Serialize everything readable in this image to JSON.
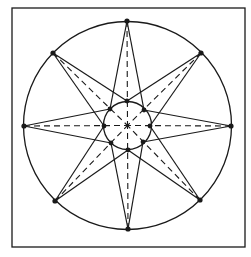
{
  "diagram": {
    "title": "",
    "type": "eight-pointed star construction",
    "colors": {
      "stroke": "#1a1a1a",
      "background": "#ffffff"
    },
    "frame": {
      "x": 12,
      "y": 8,
      "width": 233,
      "height": 239
    },
    "outer_circle": {
      "cx": 127.5,
      "cy": 125.5,
      "r": 104
    },
    "inner_circle": {
      "cx": 127.5,
      "cy": 125.5,
      "r": 24
    },
    "outer_points": [
      {
        "name": "top",
        "x": 127,
        "y": 21
      },
      {
        "name": "top-right",
        "x": 201,
        "y": 53
      },
      {
        "name": "right",
        "x": 231,
        "y": 126
      },
      {
        "name": "bottom-right",
        "x": 200,
        "y": 200
      },
      {
        "name": "bottom",
        "x": 128,
        "y": 229
      },
      {
        "name": "bottom-left",
        "x": 55,
        "y": 201
      },
      {
        "name": "left",
        "x": 24,
        "y": 126
      },
      {
        "name": "top-left",
        "x": 53,
        "y": 53
      }
    ],
    "inner_points": [
      {
        "name": "top",
        "x": 127,
        "y": 101
      },
      {
        "name": "top-right",
        "x": 144,
        "y": 110
      },
      {
        "name": "right",
        "x": 150,
        "y": 126
      },
      {
        "name": "bottom-right",
        "x": 143,
        "y": 142
      },
      {
        "name": "bottom",
        "x": 128,
        "y": 150
      },
      {
        "name": "bottom-left",
        "x": 111,
        "y": 143
      },
      {
        "name": "left",
        "x": 104,
        "y": 126
      },
      {
        "name": "top-left",
        "x": 110,
        "y": 109
      }
    ],
    "star_edges_rule": "cardinal outer point connects to adjacent diagonal inner points; diagonal outer point connects to adjacent cardinal inner points",
    "dashed_lines": "each outer point to the center"
  }
}
